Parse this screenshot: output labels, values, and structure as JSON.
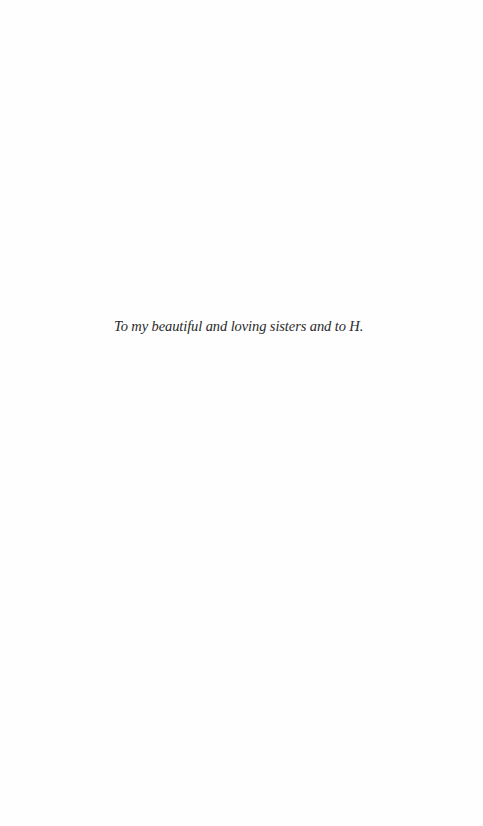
{
  "page": {
    "type": "dedication",
    "dedication_text": "To my beautiful and loving sisters and to H."
  },
  "colors": {
    "background": "#fefefe",
    "text": "#2a2a2a"
  }
}
